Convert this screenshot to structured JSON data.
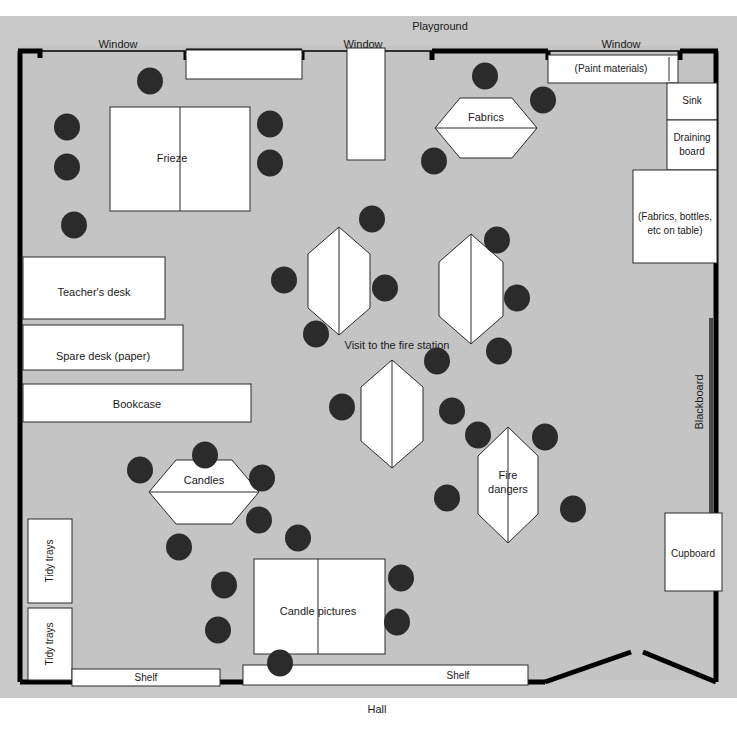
{
  "colors": {
    "room_fill": "#c4c4c4",
    "outer_fill": "#c9c9c9",
    "furniture_fill": "#ffffff",
    "chair_fill": "#2b2b2b",
    "wall_stroke": "#000000",
    "text": "#1a1a1a"
  },
  "exterior_labels": {
    "top": "Playground",
    "bottom": "Hall"
  },
  "windows": [
    {
      "label": "Window",
      "x": 118,
      "y": 45
    },
    {
      "label": "Window",
      "x": 363,
      "y": 45
    },
    {
      "label": "Window",
      "x": 621,
      "y": 45
    }
  ],
  "furniture": [
    {
      "name": "frieze-table",
      "label": "Frieze",
      "shape": "rect",
      "x": 110,
      "y": 107,
      "w": 140,
      "h": 104,
      "split": "vertical"
    },
    {
      "name": "teachers-desk",
      "label": "Teacher's desk",
      "shape": "rect",
      "x": 23,
      "y": 257,
      "w": 142,
      "h": 62,
      "split": "none"
    },
    {
      "name": "spare-desk",
      "label": "Spare desk (paper)",
      "shape": "rect",
      "x": 23,
      "y": 325,
      "w": 160,
      "h": 45,
      "split": "none"
    },
    {
      "name": "bookcase",
      "label": "Bookcase",
      "shape": "rect",
      "x": 23,
      "y": 384,
      "w": 228,
      "h": 38,
      "split": "none"
    },
    {
      "name": "tidy-trays-upper",
      "label": "Tidy trays",
      "shape": "rect",
      "x": 28,
      "y": 519,
      "w": 44,
      "h": 84,
      "split": "none",
      "rotate": -90
    },
    {
      "name": "tidy-trays-lower",
      "label": "Tidy trays",
      "shape": "rect",
      "x": 28,
      "y": 608,
      "w": 44,
      "h": 72,
      "split": "none",
      "rotate": -90
    },
    {
      "name": "shelf-left",
      "label": "Shelf",
      "shape": "rect",
      "x": 72,
      "y": 669,
      "w": 148,
      "h": 17,
      "split": "none"
    },
    {
      "name": "shelf-right",
      "label": "Shelf",
      "shape": "rect",
      "x": 243,
      "y": 665,
      "w": 285,
      "h": 20,
      "split": "none"
    },
    {
      "name": "candle-pictures-table",
      "label": "Candle pictures",
      "shape": "rect",
      "x": 254,
      "y": 559,
      "w": 131,
      "h": 95,
      "split": "vertical"
    },
    {
      "name": "paint-materials-unit",
      "label": "(Paint materials)",
      "shape": "rect",
      "x": 548,
      "y": 55,
      "w": 130,
      "h": 28,
      "split": "none"
    },
    {
      "name": "sink",
      "label": "Sink",
      "shape": "rect",
      "x": 667,
      "y": 83,
      "w": 50,
      "h": 37,
      "split": "none"
    },
    {
      "name": "draining-board",
      "label": "Draining board",
      "shape": "rect",
      "x": 667,
      "y": 120,
      "w": 50,
      "h": 50,
      "split": "none"
    },
    {
      "name": "side-table",
      "label": "(Fabrics, bottles, etc on table)",
      "shape": "rect",
      "x": 633,
      "y": 170,
      "w": 84,
      "h": 93,
      "split": "none"
    },
    {
      "name": "cupboard",
      "label": "Cupboard",
      "shape": "rect",
      "x": 665,
      "y": 513,
      "w": 57,
      "h": 78,
      "split": "none"
    },
    {
      "name": "window-alcove-left",
      "label": "",
      "shape": "rect",
      "x": 186,
      "y": 50,
      "w": 116,
      "h": 29,
      "split": "none"
    },
    {
      "name": "window-alcove-mid",
      "label": "",
      "shape": "rect",
      "x": 347,
      "y": 48,
      "w": 38,
      "h": 112,
      "split": "none"
    }
  ],
  "hex_tables": [
    {
      "name": "fabrics-table",
      "label": "Fabrics",
      "cx": 486,
      "cy": 128,
      "rx": 51,
      "ry": 30,
      "orientation": "horizontal"
    },
    {
      "name": "candles-table",
      "label": "Candles",
      "cx": 204,
      "cy": 492,
      "rx": 55,
      "ry": 32,
      "orientation": "horizontal"
    },
    {
      "name": "fire-station-table-1",
      "label": "",
      "cx": 339,
      "cy": 281,
      "rx": 31,
      "ry": 54,
      "orientation": "vertical"
    },
    {
      "name": "fire-station-table-2",
      "label": "",
      "cx": 471,
      "cy": 289,
      "rx": 32,
      "ry": 55,
      "orientation": "vertical"
    },
    {
      "name": "fire-station-table-3",
      "label": "",
      "cx": 392,
      "cy": 414,
      "rx": 31,
      "ry": 54,
      "orientation": "vertical"
    },
    {
      "name": "fire-dangers-table",
      "label": "Fire dangers",
      "cx": 508,
      "cy": 485,
      "rx": 30,
      "ry": 58,
      "orientation": "vertical"
    }
  ],
  "group_labels": [
    {
      "name": "fire-station-group-label",
      "label": "Visit to the fire station",
      "x": 397,
      "y": 346
    }
  ],
  "wall_labels": [
    {
      "name": "blackboard-label",
      "label": "Blackboard",
      "x": 704,
      "y": 402,
      "rotate": -90
    }
  ],
  "chairs": [
    {
      "cx": 150,
      "cy": 81
    },
    {
      "cx": 67,
      "cy": 127
    },
    {
      "cx": 67,
      "cy": 167
    },
    {
      "cx": 74,
      "cy": 225
    },
    {
      "cx": 270,
      "cy": 124
    },
    {
      "cx": 270,
      "cy": 163
    },
    {
      "cx": 485,
      "cy": 76
    },
    {
      "cx": 543,
      "cy": 100
    },
    {
      "cx": 434,
      "cy": 161
    },
    {
      "cx": 372,
      "cy": 219
    },
    {
      "cx": 497,
      "cy": 240
    },
    {
      "cx": 284,
      "cy": 280
    },
    {
      "cx": 385,
      "cy": 288
    },
    {
      "cx": 517,
      "cy": 298
    },
    {
      "cx": 316,
      "cy": 334
    },
    {
      "cx": 499,
      "cy": 351
    },
    {
      "cx": 437,
      "cy": 361
    },
    {
      "cx": 342,
      "cy": 407
    },
    {
      "cx": 452,
      "cy": 411
    },
    {
      "cx": 478,
      "cy": 435
    },
    {
      "cx": 545,
      "cy": 437
    },
    {
      "cx": 205,
      "cy": 455
    },
    {
      "cx": 140,
      "cy": 470
    },
    {
      "cx": 262,
      "cy": 478
    },
    {
      "cx": 259,
      "cy": 520
    },
    {
      "cx": 179,
      "cy": 547
    },
    {
      "cx": 298,
      "cy": 538
    },
    {
      "cx": 447,
      "cy": 498
    },
    {
      "cx": 573,
      "cy": 509
    },
    {
      "cx": 224,
      "cy": 585
    },
    {
      "cx": 218,
      "cy": 630
    },
    {
      "cx": 401,
      "cy": 578
    },
    {
      "cx": 397,
      "cy": 622
    },
    {
      "cx": 280,
      "cy": 663
    }
  ],
  "chair_radius": 13,
  "chair_count": 34
}
